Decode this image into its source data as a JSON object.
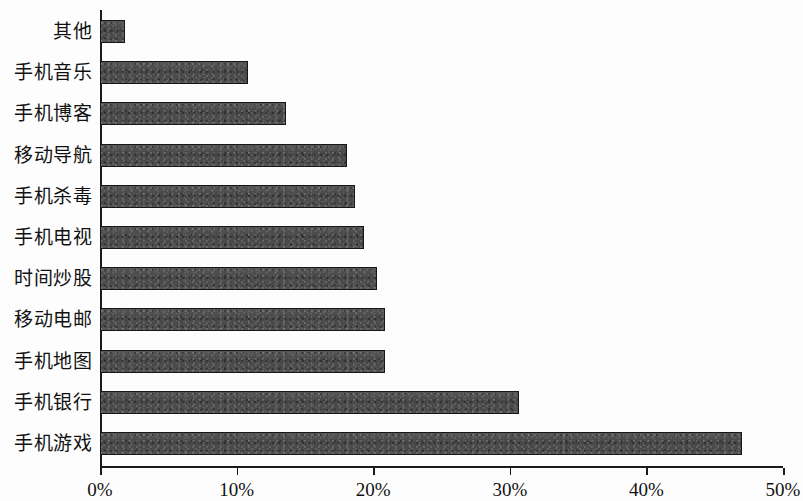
{
  "chart_data": {
    "type": "bar",
    "orientation": "horizontal",
    "title": "",
    "subtitle": "",
    "xlabel": "",
    "ylabel": "",
    "xlim": [
      0,
      50
    ],
    "xtick_labels": [
      "0%",
      "10%",
      "20%",
      "30%",
      "40%",
      "50%"
    ],
    "xticks": [
      0,
      10,
      20,
      30,
      40,
      50
    ],
    "grid": false,
    "legend": false,
    "value_unit": "%",
    "bar_color": "#4d4d4d",
    "bar_border_color": "#171717",
    "axis_color": "#1a1a1a",
    "background_color": "#fdfdfd",
    "categories": [
      "其他",
      "手机音乐",
      "手机博客",
      "移动导航",
      "手机杀毒",
      "手机电视",
      "时间炒股",
      "移动电邮",
      "手机地图",
      "手机银行",
      "手机游戏"
    ],
    "values": [
      1.8,
      10.8,
      13.6,
      18.1,
      18.7,
      19.3,
      20.3,
      20.9,
      20.9,
      30.7,
      47.0
    ]
  }
}
